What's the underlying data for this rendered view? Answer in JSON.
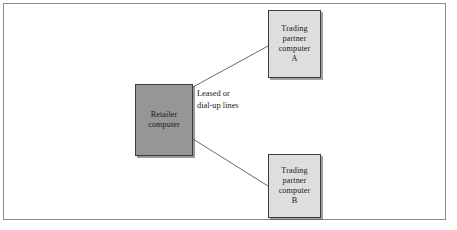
{
  "figure": {
    "border_color": "#8d8d8d",
    "background": "#ffffff"
  },
  "diagram": {
    "type": "node-link",
    "nodes": [
      {
        "id": "retailer",
        "lines": [
          "Retailer",
          "computer"
        ],
        "fill": "#969696",
        "stroke": "#3c3c3c",
        "shape": "rectangle"
      },
      {
        "id": "partner-a",
        "lines": [
          "Trading",
          "partner",
          "computer",
          "A"
        ],
        "fill": "#dedede",
        "stroke": "#3c3c3c",
        "shape": "rectangle"
      },
      {
        "id": "partner-b",
        "lines": [
          "Trading",
          "partner",
          "computer",
          "B"
        ],
        "fill": "#dedede",
        "stroke": "#3c3c3c",
        "shape": "rectangle"
      }
    ],
    "edges": [
      {
        "id": "edge-retailer-a",
        "from": "retailer",
        "to": "partner-a",
        "style": "solid",
        "color": "#6a6a6a"
      },
      {
        "id": "edge-retailer-b",
        "from": "retailer",
        "to": "partner-b",
        "style": "solid",
        "color": "#6a6a6a"
      }
    ],
    "edge_label": {
      "lines": [
        "Leased or",
        "dial-up lines"
      ]
    }
  },
  "nodes": {
    "retailer": {
      "line1": "Retailer",
      "line2": "computer"
    },
    "partner_a": {
      "line1": "Trading",
      "line2": "partner",
      "line3": "computer",
      "line4": "A"
    },
    "partner_b": {
      "line1": "Trading",
      "line2": "partner",
      "line3": "computer",
      "line4": "B"
    }
  },
  "edge_label": {
    "line1": "Leased or",
    "line2": "dial-up lines"
  }
}
